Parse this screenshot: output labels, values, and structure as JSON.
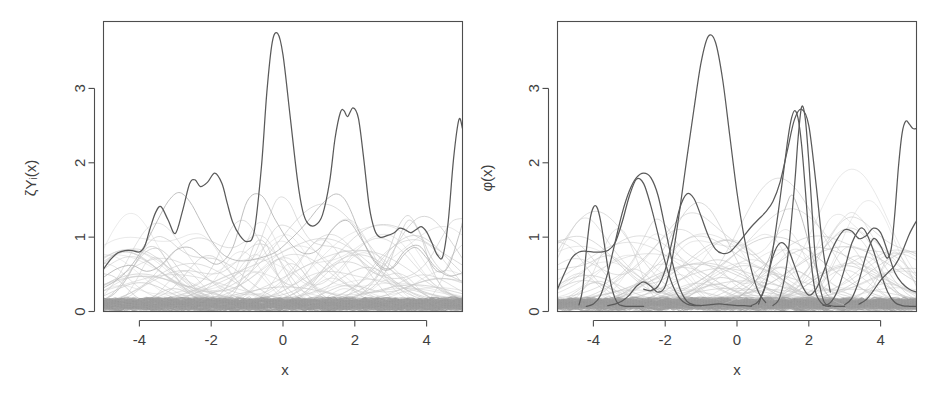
{
  "figure": {
    "width": 944,
    "height": 400,
    "background": "#ffffff",
    "panel_count": 2
  },
  "colors": {
    "axis": "#4d4d4d",
    "text": "#3f3f3f",
    "dark_curve": "#5a5a5a",
    "gray_curve": "#b4b4b4",
    "faint_curve": "#c9c9c9",
    "band_curve": "#9e9e9e"
  },
  "chart_data": [
    {
      "type": "line",
      "panel": "left",
      "title": "",
      "xlabel": "x",
      "ylabel": "ζYᵢ(x)",
      "xlim": [
        -5,
        5
      ],
      "ylim": [
        0,
        3.9
      ],
      "xticks": [
        -4,
        -2,
        0,
        2,
        4
      ],
      "xtick_labels": [
        "-4",
        "-2",
        "0",
        "2",
        "4"
      ],
      "yticks": [
        0,
        1,
        2,
        3
      ],
      "ytick_labels": [
        "0",
        "1",
        "2",
        "3"
      ],
      "grid": false,
      "legend": "none",
      "box": true,
      "description": "One highlighted dark envelope curve over a dense bundle of light grey curves.",
      "series": [
        {
          "name": "envelope",
          "style": "dark",
          "x": [
            -5.0,
            -4.8,
            -4.6,
            -4.4,
            -4.2,
            -4.0,
            -3.85,
            -3.7,
            -3.55,
            -3.4,
            -3.2,
            -3.0,
            -2.8,
            -2.6,
            -2.45,
            -2.3,
            -2.1,
            -1.9,
            -1.7,
            -1.55,
            -1.4,
            -1.2,
            -1.0,
            -0.8,
            -0.6,
            -0.45,
            -0.3,
            -0.15,
            0.0,
            0.2,
            0.4,
            0.55,
            0.7,
            0.9,
            1.1,
            1.3,
            1.45,
            1.6,
            1.7,
            1.8,
            1.95,
            2.1,
            2.25,
            2.4,
            2.55,
            2.7,
            2.9,
            3.1,
            3.25,
            3.4,
            3.55,
            3.7,
            3.85,
            4.0,
            4.15,
            4.3,
            4.45,
            4.6,
            4.75,
            4.9,
            5.0
          ],
          "y": [
            0.57,
            0.7,
            0.79,
            0.82,
            0.82,
            0.8,
            0.88,
            1.12,
            1.33,
            1.41,
            1.23,
            1.05,
            1.35,
            1.72,
            1.77,
            1.68,
            1.74,
            1.86,
            1.72,
            1.45,
            1.2,
            1.02,
            0.94,
            1.08,
            1.95,
            2.95,
            3.62,
            3.74,
            3.45,
            2.62,
            1.78,
            1.35,
            1.18,
            1.16,
            1.3,
            1.75,
            2.33,
            2.68,
            2.7,
            2.62,
            2.74,
            2.6,
            2.05,
            1.42,
            1.1,
            1.0,
            1.02,
            1.06,
            1.12,
            1.1,
            1.06,
            1.1,
            1.14,
            1.07,
            0.92,
            0.76,
            0.74,
            1.2,
            2.05,
            2.58,
            2.46
          ]
        },
        {
          "name": "secondary-grey-1",
          "style": "mid",
          "x": [
            -5.0,
            -4.7,
            -4.4,
            -4.1,
            -3.8,
            -3.5,
            -3.2,
            -2.9,
            -2.6,
            -2.3,
            -2.0,
            -1.7,
            -1.4,
            -1.1,
            -0.8,
            -0.5,
            -0.2,
            0.1,
            0.4,
            0.7,
            1.0,
            1.3,
            1.5,
            1.7,
            1.9,
            2.2,
            2.5,
            2.8,
            3.1,
            3.4,
            3.7,
            4.0,
            4.3,
            4.6,
            4.9,
            5.0
          ],
          "y": [
            0.32,
            0.4,
            0.52,
            0.7,
            0.94,
            1.22,
            1.48,
            1.6,
            1.48,
            1.22,
            0.96,
            0.78,
            0.7,
            0.68,
            0.7,
            0.74,
            0.8,
            0.92,
            1.06,
            1.22,
            1.4,
            1.54,
            1.58,
            1.52,
            1.34,
            0.98,
            0.7,
            0.56,
            0.6,
            0.78,
            0.86,
            0.72,
            0.54,
            0.6,
            1.02,
            1.2
          ]
        },
        {
          "name": "secondary-grey-2",
          "style": "mid",
          "x": [
            -5.0,
            -4.6,
            -4.2,
            -3.8,
            -3.4,
            -3.0,
            -2.6,
            -2.2,
            -1.8,
            -1.4,
            -1.0,
            -0.6,
            -0.2,
            0.2,
            0.6,
            1.0,
            1.4,
            1.8,
            2.2,
            2.6,
            3.0,
            3.4,
            3.8,
            4.2,
            4.6,
            5.0
          ],
          "y": [
            0.46,
            0.58,
            0.62,
            0.54,
            0.62,
            0.82,
            0.86,
            0.72,
            0.64,
            0.86,
            1.48,
            1.56,
            1.22,
            0.92,
            0.78,
            0.84,
            1.12,
            1.22,
            0.96,
            0.66,
            0.58,
            0.82,
            0.88,
            0.62,
            0.48,
            0.52
          ]
        }
      ],
      "background_bundle": {
        "count": 60,
        "style": "faint",
        "baseline_band": [
          0.03,
          0.16
        ],
        "bump_height_range": [
          0.15,
          0.95
        ]
      }
    },
    {
      "type": "line",
      "panel": "right",
      "title": "",
      "xlabel": "x",
      "ylabel": "φ(x)",
      "xlim": [
        -5,
        5
      ],
      "ylim": [
        0,
        3.9
      ],
      "xticks": [
        -4,
        -2,
        0,
        2,
        4
      ],
      "xtick_labels": [
        "-4",
        "-2",
        "0",
        "2",
        "4"
      ],
      "yticks": [
        0,
        1,
        2,
        3
      ],
      "ytick_labels": [
        "0",
        "1",
        "2",
        "3"
      ],
      "grid": false,
      "legend": "none",
      "box": true,
      "description": "Several individual dark curves that cross each other, over the same dense bundle of light grey curves.",
      "series": [
        {
          "name": "dark-1",
          "style": "dark",
          "x": [
            -5.0,
            -4.8,
            -4.6,
            -4.4,
            -4.2,
            -4.0,
            -3.8,
            -3.6,
            -3.4,
            -3.2,
            -3.0,
            -2.8,
            -2.6,
            -2.4,
            -2.2,
            -2.0,
            -1.8,
            -1.6,
            -1.4,
            -1.2,
            -1.0,
            -0.8,
            -0.6,
            -0.4,
            -0.2,
            0.0,
            0.2,
            0.4
          ],
          "y": [
            0.3,
            0.52,
            0.72,
            0.8,
            0.81,
            0.8,
            0.8,
            0.82,
            0.92,
            1.2,
            1.55,
            1.78,
            1.72,
            1.42,
            1.04,
            0.66,
            0.36,
            0.18,
            0.1,
            0.08,
            0.08,
            0.09,
            0.1,
            0.1,
            0.09,
            0.08,
            0.08,
            0.07
          ]
        },
        {
          "name": "dark-2",
          "style": "dark",
          "x": [
            -4.4,
            -4.3,
            -4.2,
            -4.1,
            -4.0,
            -3.9,
            -3.8,
            -3.7,
            -3.6,
            -3.5,
            -3.4,
            -3.3,
            -3.2,
            -3.1,
            -3.0,
            -2.9,
            -2.8,
            -2.7,
            -2.6
          ],
          "y": [
            0.09,
            0.3,
            0.8,
            1.22,
            1.4,
            1.4,
            1.22,
            0.92,
            0.6,
            0.34,
            0.18,
            0.1,
            0.08,
            0.07,
            0.07,
            0.07,
            0.07,
            0.07,
            0.07
          ]
        },
        {
          "name": "dark-3",
          "style": "dark",
          "x": [
            -4.2,
            -4.0,
            -3.8,
            -3.6,
            -3.4,
            -3.2,
            -3.0,
            -2.8,
            -2.6,
            -2.4,
            -2.2,
            -2.0,
            -1.8,
            -1.6,
            -1.4,
            -1.2,
            -1.0
          ],
          "y": [
            0.07,
            0.1,
            0.22,
            0.52,
            0.92,
            1.32,
            1.62,
            1.8,
            1.86,
            1.8,
            1.56,
            1.12,
            0.66,
            0.32,
            0.14,
            0.09,
            0.08
          ]
        },
        {
          "name": "dark-4",
          "style": "dark",
          "x": [
            -3.6,
            -3.4,
            -3.2,
            -3.0,
            -2.8,
            -2.6,
            -2.4,
            -2.2,
            -2.0,
            -1.8,
            -1.6,
            -1.4,
            -1.2,
            -1.0,
            -0.8,
            -0.6,
            -0.4,
            -0.2,
            0.0,
            0.2,
            0.4,
            0.6,
            0.8
          ],
          "y": [
            0.08,
            0.1,
            0.14,
            0.22,
            0.34,
            0.4,
            0.34,
            0.26,
            0.34,
            0.72,
            1.35,
            2.05,
            2.72,
            3.35,
            3.7,
            3.62,
            3.12,
            2.36,
            1.6,
            1.0,
            0.56,
            0.26,
            0.12
          ]
        },
        {
          "name": "dark-5",
          "style": "dark",
          "x": [
            -2.6,
            -2.4,
            -2.2,
            -2.0,
            -1.8,
            -1.6,
            -1.4,
            -1.2,
            -1.0,
            -0.8,
            -0.6,
            -0.4,
            -0.2,
            0.0,
            0.2,
            0.4,
            0.6,
            0.8,
            1.0,
            1.2,
            1.4,
            1.6,
            1.8,
            2.0,
            2.2,
            2.4,
            2.6
          ],
          "y": [
            0.3,
            0.28,
            0.34,
            0.56,
            0.96,
            1.38,
            1.58,
            1.52,
            1.28,
            1.02,
            0.84,
            0.78,
            0.8,
            0.9,
            1.02,
            1.14,
            1.24,
            1.34,
            1.48,
            1.74,
            2.16,
            2.58,
            2.72,
            2.5,
            1.72,
            0.82,
            0.26
          ]
        },
        {
          "name": "dark-6",
          "style": "dark",
          "x": [
            0.4,
            0.6,
            0.8,
            1.0,
            1.2,
            1.4,
            1.5,
            1.6,
            1.7,
            1.8,
            1.9,
            2.0,
            2.1,
            2.2,
            2.4,
            2.6
          ],
          "y": [
            0.08,
            0.14,
            0.36,
            0.84,
            1.52,
            2.26,
            2.56,
            2.7,
            2.6,
            2.24,
            1.66,
            1.02,
            0.52,
            0.24,
            0.09,
            0.07
          ]
        },
        {
          "name": "dark-7",
          "style": "dark",
          "x": [
            1.0,
            1.2,
            1.4,
            1.6,
            1.7,
            1.8,
            1.9,
            2.0,
            2.1,
            2.2,
            2.4,
            2.6,
            2.8,
            3.0
          ],
          "y": [
            0.08,
            0.2,
            0.68,
            1.68,
            2.32,
            2.75,
            2.6,
            2.02,
            1.28,
            0.66,
            0.16,
            0.08,
            0.07,
            0.07
          ]
        },
        {
          "name": "dark-8",
          "style": "dark",
          "x": [
            0.6,
            0.8,
            1.0,
            1.2,
            1.4,
            1.6,
            1.8,
            2.0,
            2.2,
            2.4,
            2.6,
            2.8,
            3.0,
            3.2,
            3.4,
            3.6,
            3.8,
            4.0,
            4.2,
            4.4,
            4.6,
            4.8,
            5.0
          ],
          "y": [
            0.1,
            0.36,
            0.74,
            0.92,
            0.86,
            0.62,
            0.36,
            0.22,
            0.3,
            0.52,
            0.78,
            0.98,
            1.1,
            1.08,
            0.98,
            1.02,
            1.12,
            1.06,
            0.8,
            0.52,
            0.38,
            0.3,
            0.26
          ]
        },
        {
          "name": "dark-9",
          "style": "dark",
          "x": [
            2.4,
            2.6,
            2.8,
            3.0,
            3.2,
            3.4,
            3.5,
            3.6,
            3.8,
            4.0,
            4.2,
            4.4,
            4.6,
            4.8,
            5.0
          ],
          "y": [
            0.08,
            0.12,
            0.28,
            0.58,
            0.92,
            1.1,
            1.12,
            1.06,
            0.82,
            0.52,
            0.26,
            0.12,
            0.08,
            0.07,
            0.07
          ]
        },
        {
          "name": "dark-10",
          "style": "dark",
          "x": [
            3.0,
            3.2,
            3.4,
            3.6,
            3.8,
            4.0,
            4.1,
            4.2,
            4.3,
            4.4,
            4.5,
            4.6,
            4.7,
            4.8,
            4.9,
            5.0
          ],
          "y": [
            0.09,
            0.18,
            0.42,
            0.76,
            0.98,
            0.88,
            0.78,
            0.72,
            0.86,
            1.34,
            1.96,
            2.4,
            2.56,
            2.52,
            2.46,
            2.46
          ]
        },
        {
          "name": "dark-11",
          "style": "dark",
          "x": [
            3.4,
            3.6,
            3.8,
            4.0,
            4.2,
            4.4,
            4.6,
            4.8,
            5.0
          ],
          "y": [
            0.1,
            0.16,
            0.28,
            0.42,
            0.52,
            0.62,
            0.8,
            1.04,
            1.22
          ]
        },
        {
          "name": "grey-highlight",
          "style": "mid",
          "x": [
            -0.4,
            0.0,
            0.4,
            0.8,
            1.0,
            1.2,
            1.4,
            1.5,
            1.6,
            1.8,
            2.0,
            2.2,
            2.4,
            2.6,
            2.8,
            3.0
          ],
          "y": [
            0.1,
            0.18,
            0.34,
            0.62,
            0.86,
            1.18,
            1.46,
            1.56,
            1.52,
            1.26,
            0.92,
            0.58,
            0.32,
            0.18,
            0.12,
            0.09
          ]
        }
      ],
      "background_bundle": {
        "count": 60,
        "style": "faint",
        "baseline_band": [
          0.03,
          0.16
        ],
        "bump_height_range": [
          0.15,
          0.95
        ]
      }
    }
  ],
  "panels": {
    "left": {
      "name": "panel-zeta-y",
      "ylabel": "ζYᵢ(x)",
      "xlabel": "x"
    },
    "right": {
      "name": "panel-phi",
      "ylabel": "φ(x)",
      "xlabel": "x"
    }
  }
}
